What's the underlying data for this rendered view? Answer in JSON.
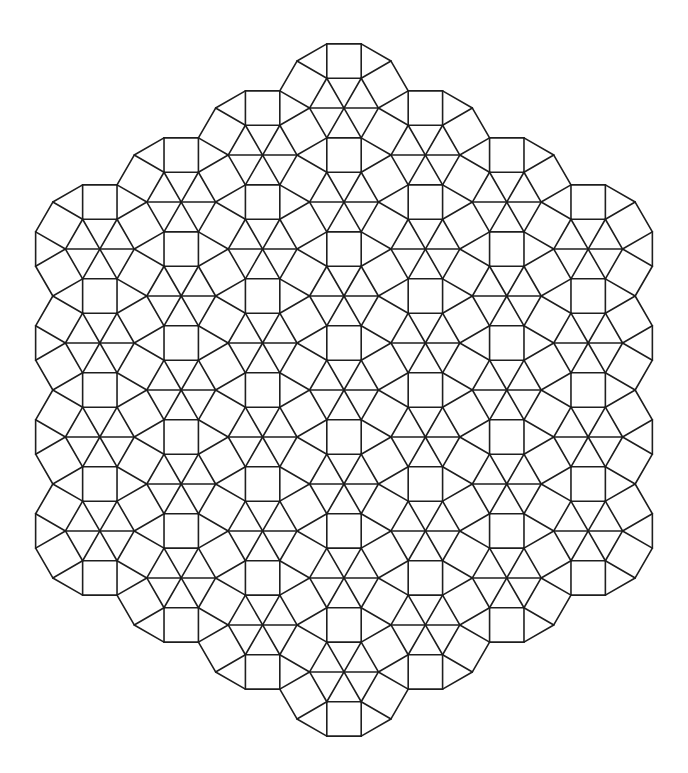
{
  "figure": {
    "background": "#ffffff",
    "stroke_color": "#1e1e1e",
    "stroke_width": 1.6,
    "edge_length": 34.4,
    "center": [
      344,
      390
    ],
    "lattice_radius": 3,
    "column_counts": [
      4,
      5,
      6,
      7,
      6,
      5,
      4
    ],
    "hexagon_orientation_deg": 0
  }
}
